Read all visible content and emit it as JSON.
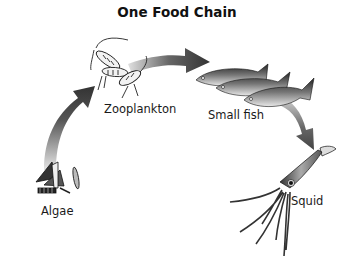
{
  "title": "One Food Chain",
  "organisms": [
    {
      "name": "Algae",
      "label": "Algae"
    },
    {
      "name": "Zooplankton",
      "label": "Zooplankton"
    },
    {
      "name": "Small fish",
      "label": "Small fish"
    },
    {
      "name": "Squid",
      "label": "Squid"
    }
  ],
  "arrows": [
    {
      "from": "Algae",
      "to": "Zooplankton"
    },
    {
      "from": "Zooplankton",
      "to": "Small fish"
    },
    {
      "from": "Small fish",
      "to": "Squid"
    }
  ],
  "colors": {
    "arrow_dark": "#3a3a3a",
    "arrow_light": "#d8d8d8",
    "text": "#1a1a1a"
  }
}
